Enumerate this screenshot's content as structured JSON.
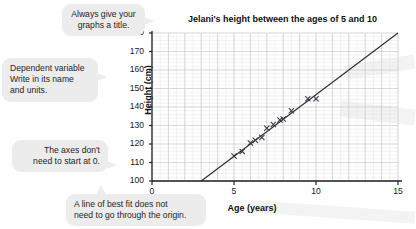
{
  "chart_data": {
    "type": "scatter",
    "title": "Jelani's height between the ages of 5 and 10",
    "xlabel": "Age (years)",
    "ylabel": "Height (cm)",
    "xlim": [
      0,
      15
    ],
    "ylim": [
      100,
      180
    ],
    "xticks": [
      "0",
      "5",
      "10",
      "15"
    ],
    "yticks": [
      "100",
      "110",
      "120",
      "130",
      "140",
      "150",
      "160",
      "170",
      "180"
    ],
    "grid": true,
    "legend": "none",
    "series": [
      {
        "name": "Jelani's measured height",
        "marker": "x",
        "points": [
          {
            "x": 5.0,
            "y": 113.5
          },
          {
            "x": 5.5,
            "y": 116.0
          },
          {
            "x": 6.0,
            "y": 120.5
          },
          {
            "x": 6.3,
            "y": 122.0
          },
          {
            "x": 6.7,
            "y": 123.5
          },
          {
            "x": 7.0,
            "y": 128.5
          },
          {
            "x": 7.4,
            "y": 130.5
          },
          {
            "x": 7.8,
            "y": 133.0
          },
          {
            "x": 8.0,
            "y": 133.5
          },
          {
            "x": 8.5,
            "y": 138.0
          },
          {
            "x": 9.5,
            "y": 144.5
          },
          {
            "x": 10.0,
            "y": 144.5
          }
        ]
      }
    ],
    "line_of_best_fit": {
      "x1": 3.0,
      "y1": 100,
      "x2": 15.0,
      "y2": 180
    }
  },
  "annotations": [
    {
      "id": "title-note",
      "lines": [
        "Always give your",
        "graphs a title."
      ],
      "align": "center"
    },
    {
      "id": "dependent-variable-note",
      "lines": [
        "Dependent variable",
        "Write in its name",
        "and units."
      ],
      "align": "left"
    },
    {
      "id": "axes-note",
      "lines": [
        "The axes don't",
        "need to start at 0."
      ],
      "align": "right"
    },
    {
      "id": "best-fit-note",
      "lines": [
        "A line of best fit does not",
        "need to go through the origin."
      ],
      "align": "left"
    }
  ],
  "colors": {
    "bubble_background": "#ececec",
    "text": "#1a1a1a",
    "axis": "#222222",
    "grid_major": "#c8c8c8",
    "grid_minor": "#e4e4e4",
    "marker": "#3b3b4a",
    "line": "#2b2b2b",
    "page_background": "#ffffff"
  }
}
